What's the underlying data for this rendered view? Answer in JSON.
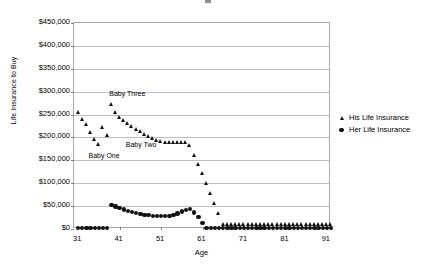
{
  "chart_data": {
    "type": "scatter",
    "title": "",
    "xlabel": "Age",
    "ylabel": "Life Insurance to Buy",
    "xlim": [
      30,
      92
    ],
    "ylim": [
      0,
      450000
    ],
    "grid": true,
    "legend_position": "right",
    "ytick_labels": [
      "$450,000",
      "$400,000",
      "$350,000",
      "$300,000",
      "$250,000",
      "$200,000",
      "$150,000",
      "$100,000",
      "$50,000",
      "$0"
    ],
    "ytick_values": [
      450000,
      400000,
      350000,
      300000,
      250000,
      200000,
      150000,
      100000,
      50000,
      0
    ],
    "xtick_labels": [
      "31",
      "41",
      "51",
      "61",
      "71",
      "81",
      "91"
    ],
    "xtick_values": [
      31,
      41,
      51,
      61,
      71,
      81,
      91
    ],
    "annotations": [
      {
        "text": "Baby Three",
        "x": 38.5,
        "y": 292000
      },
      {
        "text": "Baby Two",
        "x": 42.5,
        "y": 182000
      },
      {
        "text": "Baby One",
        "x": 33.5,
        "y": 157000
      }
    ],
    "series": [
      {
        "name": "His Life Insurance",
        "marker": "triangle",
        "color": "#111111",
        "x": [
          31,
          32,
          33,
          34,
          35,
          36,
          37,
          38,
          39,
          40,
          41,
          42,
          43,
          44,
          45,
          46,
          47,
          48,
          49,
          50,
          51,
          52,
          53,
          54,
          55,
          56,
          57,
          58,
          59,
          60,
          61,
          62,
          63,
          64,
          65,
          66,
          67,
          68,
          69,
          70,
          71,
          72,
          73,
          74,
          75,
          76,
          77,
          78,
          79,
          80,
          81,
          82,
          83,
          84,
          85,
          86,
          87,
          88,
          89,
          90,
          91,
          92
        ],
        "y": [
          256000,
          240000,
          228000,
          212000,
          197000,
          186000,
          222000,
          204000,
          272000,
          255000,
          245000,
          238000,
          231000,
          224000,
          218000,
          213000,
          208000,
          203000,
          199000,
          195000,
          192000,
          190000,
          190000,
          190000,
          190000,
          190000,
          189000,
          183000,
          161000,
          141000,
          121000,
          100000,
          79000,
          57000,
          35000,
          11000,
          11000,
          11000,
          11000,
          11000,
          11000,
          11000,
          11000,
          11000,
          11000,
          11000,
          11000,
          11000,
          11000,
          11000,
          11000,
          11000,
          11000,
          11000,
          11000,
          11000,
          11000,
          11000,
          11000,
          11000,
          11000,
          11000
        ]
      },
      {
        "name": "Her Life Insurance",
        "marker": "circle",
        "color": "#111111",
        "x": [
          31,
          32,
          33,
          34,
          35,
          36,
          37,
          38,
          39,
          40,
          41,
          42,
          43,
          44,
          45,
          46,
          47,
          48,
          49,
          50,
          51,
          52,
          53,
          54,
          55,
          56,
          57,
          58,
          59,
          60,
          61,
          62,
          63,
          64,
          65,
          66,
          67,
          68,
          69,
          70,
          71,
          72,
          73,
          74,
          75,
          76,
          77,
          78,
          79,
          80,
          81,
          82,
          83,
          84,
          85,
          86,
          87,
          88,
          89,
          90,
          91,
          92
        ],
        "y": [
          2000,
          2000,
          2000,
          2000,
          2000,
          2000,
          2000,
          2000,
          52000,
          49000,
          46000,
          43000,
          40000,
          37000,
          35000,
          33000,
          31000,
          30000,
          29000,
          28000,
          28000,
          28000,
          29000,
          31000,
          34000,
          38000,
          42000,
          44000,
          36000,
          26000,
          13000,
          2000,
          2000,
          2000,
          2000,
          2000,
          2000,
          2000,
          2000,
          2000,
          2000,
          2000,
          2000,
          2000,
          2000,
          2000,
          2000,
          2000,
          2000,
          2000,
          2000,
          2000,
          2000,
          2000,
          2000,
          2000,
          2000,
          2000,
          2000,
          2000,
          2000,
          2000
        ]
      }
    ]
  },
  "legend": {
    "items": [
      {
        "label": "His Life Insurance",
        "marker": "triangle"
      },
      {
        "label": "Her Life Insurance",
        "marker": "circle"
      }
    ]
  }
}
